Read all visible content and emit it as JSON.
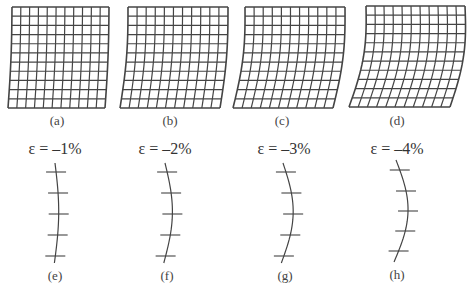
{
  "figure": {
    "panels": [
      {
        "id": "a",
        "label": "(a)",
        "type": "grid",
        "rows": 11,
        "cols": 11,
        "tl": [
          12,
          7
        ],
        "tr": [
          109,
          7
        ],
        "bl": [
          8,
          108
        ],
        "br": [
          105,
          108
        ],
        "bend": 1.0,
        "label_pos": [
          57,
          121
        ]
      },
      {
        "id": "b",
        "label": "(b)",
        "type": "grid",
        "rows": 11,
        "cols": 11,
        "tl": [
          128,
          7
        ],
        "tr": [
          228,
          7
        ],
        "bl": [
          120,
          108
        ],
        "br": [
          220,
          108
        ],
        "bend": 2.5,
        "label_pos": [
          170,
          121
        ]
      },
      {
        "id": "c",
        "label": "(c)",
        "type": "grid",
        "rows": 11,
        "cols": 11,
        "tl": [
          245,
          7
        ],
        "tr": [
          345,
          7
        ],
        "bl": [
          233,
          108
        ],
        "br": [
          333,
          108
        ],
        "bend": 4.0,
        "label_pos": [
          282,
          121
        ]
      },
      {
        "id": "d",
        "label": "(d)",
        "type": "grid",
        "rows": 11,
        "cols": 11,
        "tl": [
          366,
          6
        ],
        "tr": [
          465,
          6
        ],
        "bl": [
          349,
          107
        ],
        "br": [
          450,
          107
        ],
        "bend": 6.0,
        "label_pos": [
          397,
          121
        ]
      },
      {
        "id": "e",
        "label": "(e)",
        "type": "line",
        "strain": "ε = –1%",
        "eps_pos": [
          55,
          150
        ],
        "x": 55,
        "y0": 163,
        "y1": 263,
        "amp": 4,
        "ticks": [
          172,
          193,
          214,
          235,
          256
        ],
        "tick_len": 20,
        "label_pos": [
          55,
          276
        ]
      },
      {
        "id": "f",
        "label": "(f)",
        "type": "line",
        "strain": "ε = –2%",
        "eps_pos": [
          165,
          150
        ],
        "x": 165,
        "y0": 163,
        "y1": 263,
        "amp": 8,
        "ticks": [
          172,
          193,
          214,
          235,
          256
        ],
        "tick_len": 20,
        "label_pos": [
          167,
          276
        ]
      },
      {
        "id": "g",
        "label": "(g)",
        "type": "line",
        "strain": "ε = –3%",
        "eps_pos": [
          284,
          150
        ],
        "x": 283,
        "y0": 163,
        "y1": 263,
        "amp": 11,
        "ticks": [
          172,
          193,
          214,
          235,
          256
        ],
        "tick_len": 20,
        "label_pos": [
          285,
          276
        ]
      },
      {
        "id": "h",
        "label": "(h)",
        "type": "line",
        "strain": "ε = –4%",
        "eps_pos": [
          397,
          150
        ],
        "x": 396,
        "y0": 160,
        "y1": 262,
        "amp": 13,
        "ticks": [
          170,
          191,
          211,
          231,
          251
        ],
        "tick_len": 20,
        "label_pos": [
          397,
          275
        ]
      }
    ],
    "stroke_color": "#444444"
  }
}
